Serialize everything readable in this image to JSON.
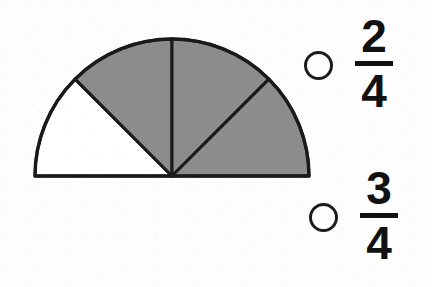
{
  "worksheet": {
    "title": "Fraction model multiple choice",
    "background_color": "#fdfdfd"
  },
  "figure": {
    "name": "semicircle-fraction-model",
    "shape": "semicircle",
    "total_parts": 4,
    "shaded_parts": 3,
    "unshaded_parts": 1,
    "sector_angle_degrees": 45,
    "shaded_color": "#8c8c8c",
    "unshaded_color": "#ffffff",
    "outline_color": "#1a1a1a",
    "center_x": 172,
    "center_y": 176,
    "radius": 137,
    "shaded_sector_labels": [
      "sector-2",
      "sector-3",
      "sector-4"
    ],
    "unshaded_sector_labels": [
      "sector-1"
    ]
  },
  "options": [
    {
      "id": "option-a",
      "numerator": "2",
      "denominator": "4",
      "value": "2/4",
      "selected": false
    },
    {
      "id": "option-b",
      "numerator": "3",
      "denominator": "4",
      "value": "3/4",
      "selected": false
    }
  ]
}
